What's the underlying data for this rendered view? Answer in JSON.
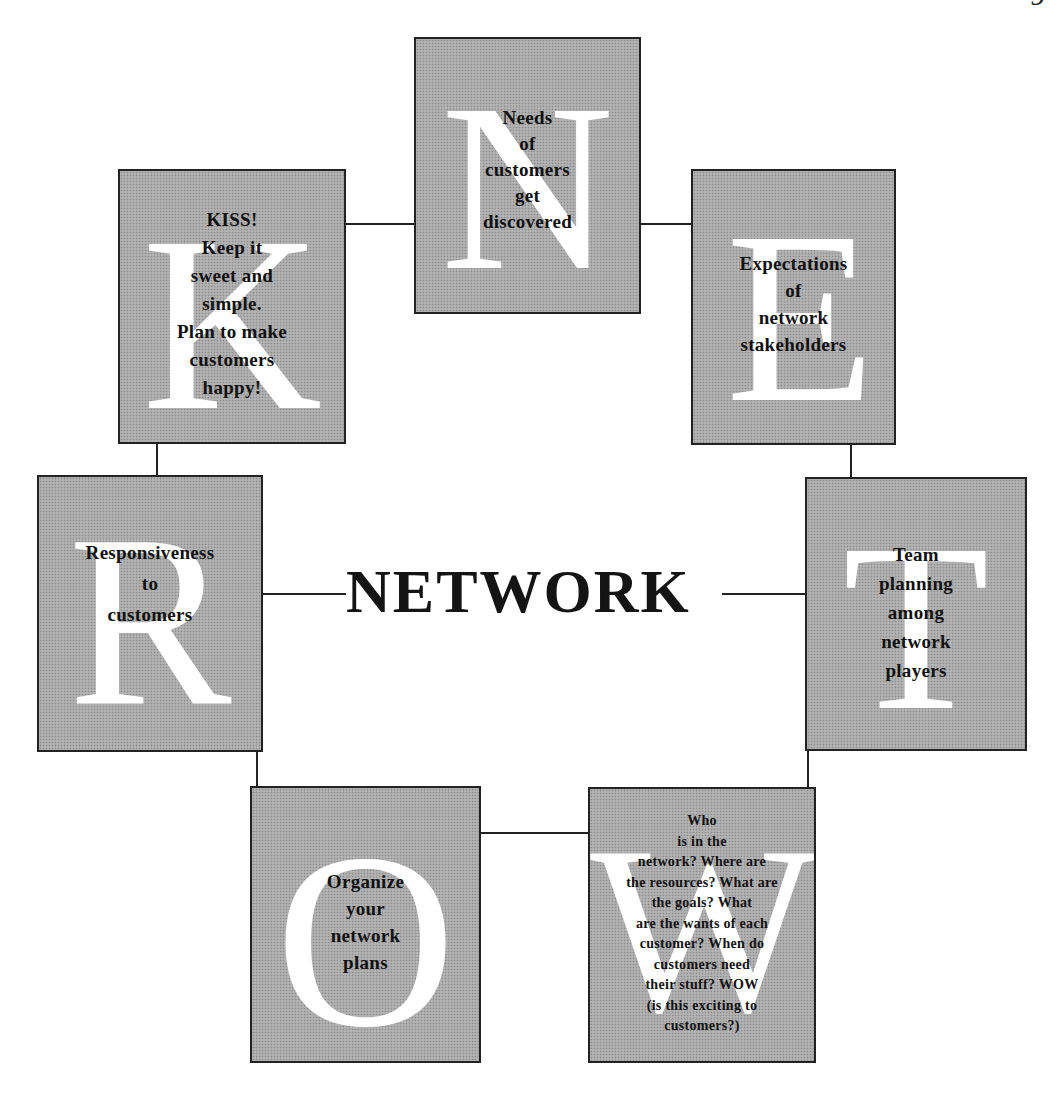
{
  "page_number": "9",
  "center": {
    "title": "NETWORK"
  },
  "boxes": {
    "n": {
      "letter": "N",
      "text": "Needs\nof\ncustomers\nget\ndiscovered"
    },
    "e": {
      "letter": "E",
      "text": "Expectations\nof\nnetwork\nstakeholders"
    },
    "t": {
      "letter": "T",
      "text": "Team\nplanning\namong\nnetwork\nplayers"
    },
    "w": {
      "letter": "W",
      "text": "Who\nis in the\nnetwork?  Where are\nthe resources? What are\nthe goals? What\nare the wants of each\ncustomer? When do\ncustomers need\ntheir stuff? WOW\n(is this exciting to\ncustomers?)"
    },
    "o": {
      "letter": "O",
      "text": "Organize\nyour\nnetwork\nplans"
    },
    "r": {
      "letter": "R",
      "text": "Responsiveness\nto\ncustomers"
    },
    "k": {
      "letter": "K",
      "text": "KISS!\nKeep it\nsweet and\nsimple.\nPlan to make\ncustomers\nhappy!"
    }
  },
  "colors": {
    "box_fill": "#a9a9a9",
    "letter": "#ffffff",
    "text": "#111111",
    "lines": "#222222"
  }
}
